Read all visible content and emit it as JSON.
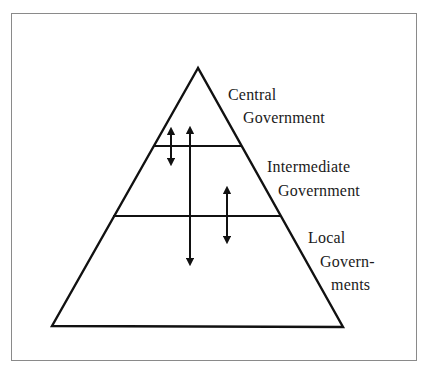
{
  "diagram": {
    "type": "pyramid",
    "levels": [
      {
        "name": "central",
        "line1": "Central",
        "line2": "Government"
      },
      {
        "name": "intermediate",
        "line1": "Intermediate",
        "line2": "Government"
      },
      {
        "name": "local",
        "line1": "Local",
        "line2": "Govern-",
        "line3": "ments"
      }
    ],
    "arrows": [
      {
        "from": "central",
        "to": "intermediate",
        "direction": "bidirectional"
      },
      {
        "from": "central",
        "to": "local",
        "direction": "bidirectional"
      },
      {
        "from": "intermediate",
        "to": "local",
        "direction": "bidirectional"
      }
    ],
    "colors": {
      "line": "#111111",
      "frame": "#8a8a8a",
      "background": "#ffffff"
    }
  }
}
